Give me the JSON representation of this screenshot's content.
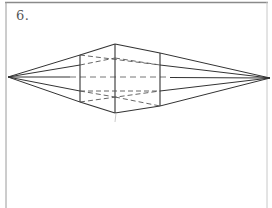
{
  "figure": {
    "label": "6.",
    "colors": {
      "line": "#333333",
      "dash": "#555555",
      "faint": "#aaaaaa",
      "border": "#777777"
    }
  },
  "diagram": {
    "type": "two-point-perspective-box",
    "vanishing_points": {
      "left": [
        8,
        77
      ],
      "right": [
        270,
        78
      ]
    },
    "horizon_y": 77,
    "edges": {
      "front": {
        "x": 115,
        "top": 44,
        "bottom": 113
      },
      "left": {
        "x": 80,
        "top": 55,
        "bottom": 102
      },
      "right": {
        "x": 160,
        "top": 53,
        "bottom": 106
      }
    }
  }
}
